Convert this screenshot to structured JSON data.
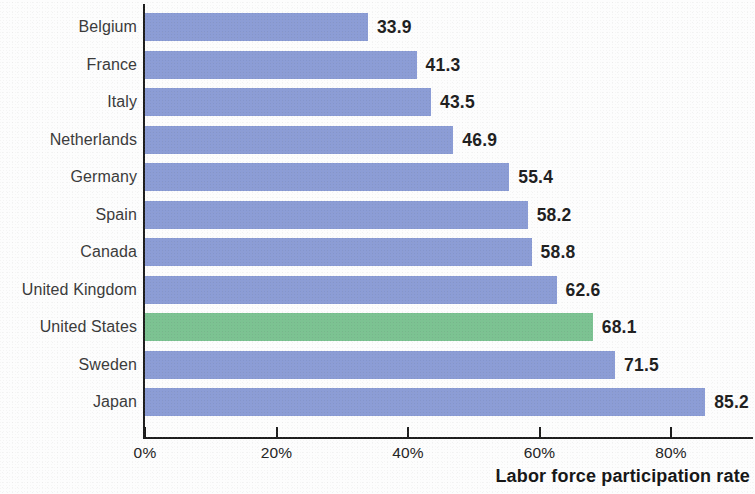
{
  "chart_data": {
    "type": "bar",
    "orientation": "horizontal",
    "title": "",
    "subtitle": "",
    "xlabel": "Labor force participation rate",
    "ylabel": "",
    "categories": [
      "Belgium",
      "France",
      "Italy",
      "Netherlands",
      "Germany",
      "Spain",
      "Canada",
      "United Kingdom",
      "United States",
      "Sweden",
      "Japan"
    ],
    "values": [
      33.9,
      41.3,
      43.5,
      46.9,
      55.4,
      58.2,
      58.8,
      62.6,
      68.1,
      71.5,
      85.2
    ],
    "value_labels": [
      "33.9",
      "41.3",
      "43.5",
      "46.9",
      "55.4",
      "58.2",
      "58.8",
      "62.6",
      "68.1",
      "71.5",
      "85.2"
    ],
    "highlight_index": 8,
    "highlight_category": "United States",
    "xlim": [
      0,
      92.8
    ],
    "xticks": [
      0,
      20,
      40,
      60,
      80
    ],
    "xtick_labels": [
      "0%",
      "20%",
      "40%",
      "60%",
      "80%"
    ],
    "grid": false,
    "legend": null,
    "colors": {
      "bar": "#8c9dd6",
      "highlight_bar": "#7cc392",
      "axis": "#1d1d1d",
      "text": "#232323",
      "background": "#fdfdfd"
    },
    "units": "percent"
  }
}
